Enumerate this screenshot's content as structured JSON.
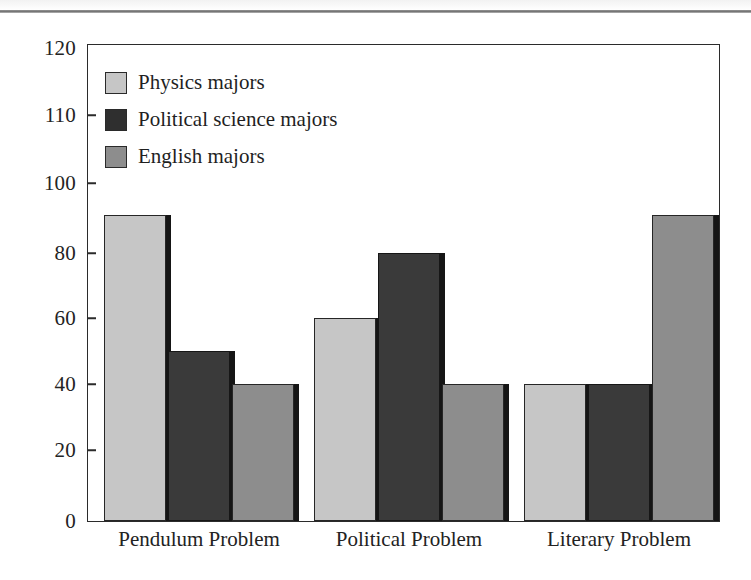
{
  "chart_data": {
    "type": "bar",
    "title": "",
    "xlabel": "",
    "ylabel": "",
    "categories": [
      "Pendulum Problem",
      "Political Problem",
      "Literary Problem"
    ],
    "series": [
      {
        "name": "Physics majors",
        "color": "#c6c6c6",
        "values": [
          91,
          60,
          40
        ]
      },
      {
        "name": "Political science majors",
        "color": "#3a3a3a",
        "values": [
          50,
          80,
          40
        ]
      },
      {
        "name": "English majors",
        "color": "#8d8d8d",
        "values": [
          40,
          40,
          91
        ]
      }
    ],
    "ylim": [
      0,
      120
    ],
    "y_ticks": [
      0,
      20,
      40,
      60,
      80,
      100,
      110,
      120
    ],
    "y_tick_labels": [
      "0",
      "20",
      "40",
      "60",
      "80",
      "100",
      "110",
      "120"
    ],
    "y_tick_positions_px": [
      521,
      450,
      384,
      318,
      253,
      183,
      115,
      48
    ],
    "grid": false,
    "legend_position": "top-left"
  },
  "legend": {
    "items": [
      {
        "label": "Physics majors"
      },
      {
        "label": "Political science majors"
      },
      {
        "label": "English majors"
      }
    ]
  }
}
